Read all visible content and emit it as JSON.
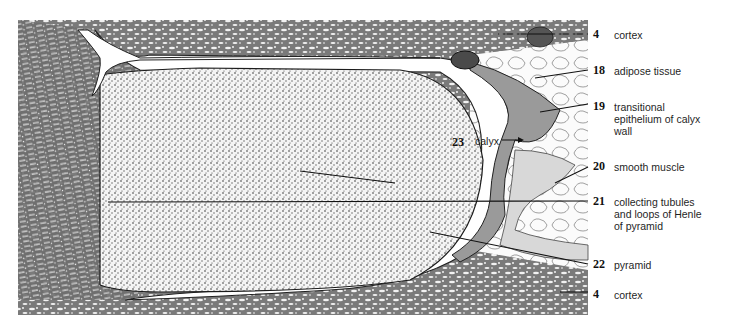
{
  "figure": {
    "colors": {
      "ink": "#1a1a1a",
      "background": "#ffffff",
      "tissue_gray": "#8a8a8a"
    }
  },
  "labels": [
    {
      "number": "4",
      "text": "cortex"
    },
    {
      "number": "18",
      "text": "adipose tissue"
    },
    {
      "number": "19",
      "text": "transitional epithelium of calyx wall",
      "lines": [
        "transitional",
        "epithelium of calyx",
        "wall"
      ]
    },
    {
      "number": "20",
      "text": "smooth muscle"
    },
    {
      "number": "21",
      "text": "collecting tubules and loops of Henle of pyramid",
      "lines": [
        "collecting tubules",
        "and loops of Henle",
        "of pyramid"
      ]
    },
    {
      "number": "22",
      "text": "pyramid"
    },
    {
      "number": "4",
      "text": "cortex"
    }
  ],
  "inline_label": {
    "number": "23",
    "text": "calyx",
    "arrow": "→"
  }
}
